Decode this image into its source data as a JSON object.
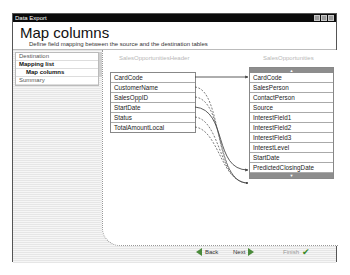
{
  "window": {
    "title": "Data Export",
    "controls": [
      "minimize",
      "maximize",
      "close"
    ]
  },
  "header": {
    "title": "Map columns",
    "subtitle": "Define field mapping between the source and the destination tables"
  },
  "sidebar": {
    "items": [
      {
        "label": "Destination",
        "bold": false,
        "sub": false
      },
      {
        "label": "Mapping list",
        "bold": true,
        "sub": false
      },
      {
        "label": "Map columns",
        "bold": true,
        "sub": true
      },
      {
        "label": "Summary",
        "bold": false,
        "sub": false
      }
    ]
  },
  "source": {
    "title": "SalesOpportunitiesHeader",
    "fields": [
      "CardCode",
      "CustomerName",
      "SalesOppID",
      "StartDate",
      "Status",
      "TotalAmountLocal"
    ]
  },
  "destination": {
    "title": "SalesOpportunities",
    "scroll_up": "▲",
    "scroll_down": "▼",
    "fields": [
      "CardCode",
      "SalesPerson",
      "ContactPerson",
      "Source",
      "InterestField1",
      "InterestField2",
      "InterestField3",
      "InterestLevel",
      "StartDate",
      "PredictedClosingDate"
    ]
  },
  "mappings": [
    {
      "from": "CardCode",
      "to": "CardCode",
      "style": "solid"
    },
    {
      "from": "StartDate",
      "to": "StartDate",
      "style": "solid"
    },
    {
      "from": "CustomerName",
      "to": "(below list)",
      "style": "dashed"
    },
    {
      "from": "SalesOppID",
      "to": "(below list)",
      "style": "dashed"
    },
    {
      "from": "Status",
      "to": "(below list)",
      "style": "dashed"
    },
    {
      "from": "TotalAmountLocal",
      "to": "(below list)",
      "style": "dashed"
    }
  ],
  "footer": {
    "back_label": "Back",
    "next_label": "Next",
    "finish_label": "Finish"
  }
}
